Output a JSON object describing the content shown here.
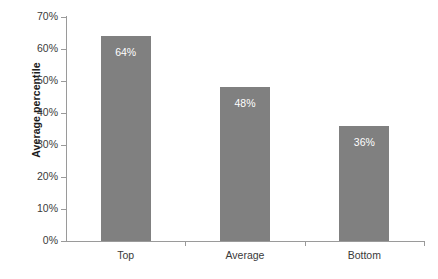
{
  "chart_data": {
    "type": "bar",
    "title": "",
    "subtitle": "",
    "xlabel": "",
    "ylabel": "Average percentile",
    "categories": [
      "Top",
      "Average",
      "Bottom"
    ],
    "values": [
      64,
      48,
      36
    ],
    "value_labels": [
      "64%",
      "48%",
      "36%"
    ],
    "ylim": [
      0,
      70
    ],
    "ytick_values": [
      0,
      10,
      20,
      30,
      40,
      50,
      60,
      70
    ],
    "ytick_labels": [
      "0%",
      "10%",
      "20%",
      "30%",
      "40%",
      "50%",
      "60%",
      "70%"
    ],
    "grid": false,
    "legend": false,
    "legend_position": "none",
    "bar_color": "#808080",
    "value_label_color": "#ffffff",
    "axis_color": "#9a9a9a",
    "text_color": "#3a3a3a",
    "background_color": "#ffffff"
  }
}
